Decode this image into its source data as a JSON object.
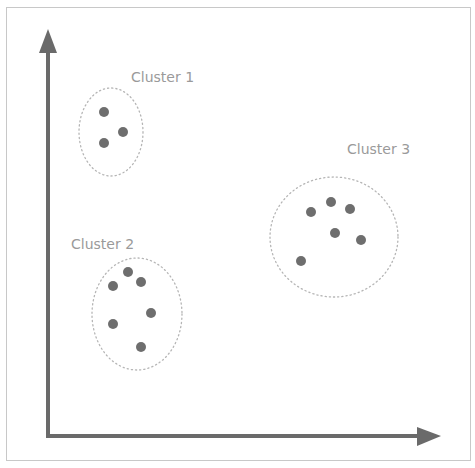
{
  "diagram": {
    "type": "cluster-scatter",
    "colors": {
      "axis": "#6a6a6a",
      "point": "#6e6e6e",
      "ellipse_border": "#b5b5b5",
      "label": "#9a9a9a",
      "frame": "#c8c8c8"
    },
    "axes": {
      "origin": [
        48,
        436
      ],
      "x_end": [
        441,
        436
      ],
      "y_end": [
        48,
        29
      ]
    },
    "clusters": [
      {
        "label": "Cluster 1",
        "label_pos": [
          131,
          82
        ],
        "ellipse": {
          "cx": 111,
          "cy": 132,
          "rx": 32,
          "ry": 44
        },
        "points": [
          [
            104,
            112
          ],
          [
            123,
            132
          ],
          [
            104,
            143
          ]
        ]
      },
      {
        "label": "Cluster 2",
        "label_pos": [
          71,
          249
        ],
        "ellipse": {
          "cx": 137,
          "cy": 314,
          "rx": 45,
          "ry": 56
        },
        "points": [
          [
            128,
            272
          ],
          [
            113,
            286
          ],
          [
            141,
            282
          ],
          [
            151,
            313
          ],
          [
            113,
            324
          ],
          [
            141,
            347
          ]
        ]
      },
      {
        "label": "Cluster 3",
        "label_pos": [
          347,
          154
        ],
        "ellipse": {
          "cx": 334,
          "cy": 237,
          "rx": 64,
          "ry": 60
        },
        "points": [
          [
            311,
            212
          ],
          [
            331,
            202
          ],
          [
            350,
            209
          ],
          [
            335,
            233
          ],
          [
            361,
            240
          ],
          [
            301,
            261
          ]
        ]
      }
    ]
  }
}
